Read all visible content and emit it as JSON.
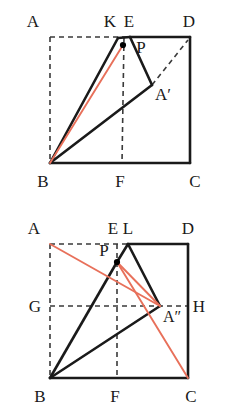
{
  "document": {
    "title": "Two geometric folding construction figures",
    "figure_count": 2
  },
  "colors": {
    "stroke_solid": "#1a1a1a",
    "stroke_dashed": "#3a3a3a",
    "stroke_accent_red": "#e8705a",
    "label_text": "#1a1a1a",
    "background": "#ffffff",
    "point_marker": "#000000"
  },
  "figures": [
    {
      "id": "figure-top",
      "name": "square-fold-figure-1",
      "labels": {
        "A": "A",
        "K": "K",
        "E": "E",
        "D": "D",
        "P": "P",
        "A_prime": "A′",
        "B": "B",
        "F": "F",
        "C": "C"
      },
      "points": {
        "A": [
          50,
          37
        ],
        "K": [
          110,
          37
        ],
        "E": [
          130,
          37
        ],
        "D": [
          190,
          37
        ],
        "P": [
          123,
          45
        ],
        "A_prime": [
          152,
          85
        ],
        "B": [
          50,
          163
        ],
        "F": [
          122,
          163
        ],
        "C": [
          190,
          163
        ]
      },
      "segments_solid": [
        [
          "B",
          "K_apex"
        ],
        [
          "K_apex",
          "P_vertex"
        ],
        [
          "P_vertex",
          "A_prime_vertex"
        ],
        [
          "A_prime_vertex",
          "B"
        ],
        [
          "E_top",
          "D"
        ],
        [
          "D",
          "C"
        ],
        [
          "C",
          "B"
        ]
      ],
      "segments_dashed": [
        [
          "A",
          "D_top_edge"
        ],
        [
          "A",
          "B"
        ],
        [
          "E_foot",
          "F"
        ],
        [
          "A_prime_vertex",
          "D"
        ]
      ],
      "segments_red": [
        [
          "B",
          "P"
        ]
      ]
    },
    {
      "id": "figure-bottom",
      "name": "square-fold-figure-2",
      "labels": {
        "A": "A",
        "E": "E",
        "L": "L",
        "D": "D",
        "P": "P",
        "G": "G",
        "A_double_prime": "A″",
        "H": "H",
        "B": "B",
        "F": "F",
        "C": "C"
      },
      "points": {
        "A": [
          50,
          244
        ],
        "E": [
          114,
          244
        ],
        "L": [
          128,
          244
        ],
        "D": [
          188,
          244
        ],
        "P": [
          117,
          262
        ],
        "G": [
          50,
          306
        ],
        "A_double_prime": [
          160,
          306
        ],
        "H": [
          188,
          306
        ],
        "B": [
          50,
          378
        ],
        "F": [
          117,
          378
        ],
        "C": [
          188,
          378
        ]
      },
      "segments_solid": [
        [
          "L_apex",
          "D"
        ],
        [
          "D",
          "C"
        ],
        [
          "C",
          "B"
        ],
        [
          "B",
          "P_vertex"
        ],
        [
          "P_vertex",
          "L_apex"
        ],
        [
          "L_apex",
          "A_double_prime"
        ],
        [
          "A_double_prime",
          "B"
        ]
      ],
      "segments_dashed": [
        [
          "A",
          "L_top"
        ],
        [
          "A",
          "B"
        ],
        [
          "G",
          "H"
        ],
        [
          "E_foot",
          "F"
        ]
      ],
      "segments_red": [
        [
          "A",
          "A_double_prime"
        ],
        [
          "P",
          "A_double_prime"
        ],
        [
          "A_double_prime",
          "C"
        ]
      ]
    }
  ]
}
